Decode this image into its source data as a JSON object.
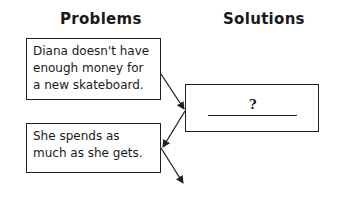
{
  "headings": {
    "problems": "Problems",
    "solutions": "Solutions"
  },
  "problems": [
    {
      "text": "Diana doesn't have enough money for a new skateboard."
    },
    {
      "text": "She spends as much as she gets."
    }
  ],
  "solutions": [
    {
      "text": "?",
      "blank": true
    }
  ],
  "colors": {
    "ink": "#222222",
    "background": "#ffffff"
  }
}
